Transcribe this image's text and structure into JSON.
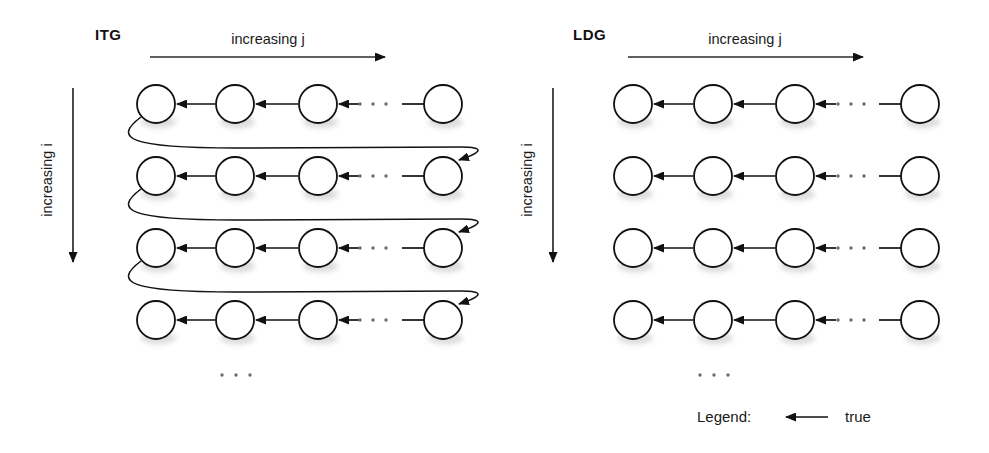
{
  "figure": {
    "width": 989,
    "height": 453,
    "background": "#ffffff",
    "ink_color": "#111111"
  },
  "panels": [
    {
      "id": "itg",
      "title": "ITG",
      "title_x": 95,
      "title_y": 40,
      "has_wraparound": true,
      "horizontal_axis": {
        "label": "increasing j",
        "label_x": 268,
        "label_y": 44,
        "line_x1": 150,
        "line_x2": 385,
        "line_y": 57
      },
      "vertical_axis": {
        "label": "increasing i",
        "label_x": 52,
        "label_y": 180,
        "line_x": 73,
        "line_y1": 88,
        "line_y2": 262
      },
      "node_cx": [
        156,
        235,
        318,
        443
      ],
      "row_cy": [
        104,
        176,
        248,
        320
      ],
      "node_r": 19,
      "ellipsis_x": [
        360,
        373,
        386
      ],
      "ellipsis_y": 104,
      "vertical_ellipsis": {
        "x": [
          222,
          236,
          250
        ],
        "y": 375
      }
    },
    {
      "id": "ldg",
      "title": "LDG",
      "title_x": 573,
      "title_y": 40,
      "has_wraparound": false,
      "horizontal_axis": {
        "label": "increasing j",
        "label_x": 745,
        "label_y": 44,
        "line_x1": 628,
        "line_x2": 863,
        "line_y": 57
      },
      "vertical_axis": {
        "label": "increasing i",
        "label_x": 532,
        "label_y": 180,
        "line_x": 553,
        "line_y1": 88,
        "line_y2": 262
      },
      "node_cx": [
        633,
        713,
        795,
        920
      ],
      "row_cy": [
        104,
        176,
        248,
        320
      ],
      "node_r": 19,
      "ellipsis_x": [
        838,
        851,
        864
      ],
      "ellipsis_y": 104,
      "vertical_ellipsis": {
        "x": [
          700,
          714,
          728
        ],
        "y": 375
      }
    }
  ],
  "legend": {
    "prefix": "Legend:",
    "prefix_x": 697,
    "prefix_y": 422,
    "arrow_x1": 828,
    "arrow_x2": 786,
    "arrow_y": 417,
    "entry_label": "true",
    "entry_label_x": 845,
    "entry_label_y": 422
  },
  "edges": {
    "direction": "right-to-left",
    "meaning": "true dependence"
  }
}
